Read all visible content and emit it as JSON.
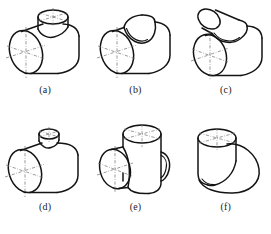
{
  "plate": {
    "title": "Intersections of cylinders with cylinders and a sphere",
    "background_color": "#ffffff",
    "line_color": "#141414",
    "centerline_color": "#6e6e6e",
    "rows": 2,
    "columns": 3
  },
  "figures": [
    {
      "label": "(a)",
      "name": "horizontal-cylinder-with-small-vertical-cylinder",
      "description": "Large horizontal cylinder with a small vertical cylinder rising from its top; shallow saddle intersection curve.",
      "base_solid": "horizontal cylinder",
      "added_solid": "vertical cylinder",
      "diameter_ratio": "small",
      "centerlines": "isometric three-axis cross on both end ellipse and top ellipse"
    },
    {
      "label": "(b)",
      "name": "horizontal-cylinder-with-large-vertical-cylinder",
      "description": "Horizontal cylinder pierced by a large vertical cylinder; deep curved saddle line of intersection cut into the top surface.",
      "base_solid": "horizontal cylinder",
      "added_solid": "vertical cylinder",
      "diameter_ratio": "large",
      "centerlines": "isometric three-axis cross on end ellipse"
    },
    {
      "label": "(c)",
      "name": "horizontal-cylinder-with-oblique-cylinder",
      "description": "Horizontal cylinder met by an inclined oblique cylinder at an angle; tangent intersection at the upper left.",
      "base_solid": "horizontal cylinder",
      "added_solid": "oblique inclined cylinder",
      "diameter_ratio": "equal",
      "centerlines": "isometric three-axis cross on end ellipse"
    },
    {
      "label": "(d)",
      "name": "horizontal-cylinder-with-tiny-boss",
      "description": "Horizontal cylinder with a very small vertical boss cylinder on top; nearly straight line of intersection.",
      "base_solid": "horizontal cylinder",
      "added_solid": "small vertical boss",
      "diameter_ratio": "very small",
      "centerlines": "isometric three-axis cross on end ellipse and boss top ellipse"
    },
    {
      "label": "(e)",
      "name": "vertical-cylinder-with-equal-horizontal-cylinder",
      "description": "Vertical cylinder joined by a horizontal cylinder of nearly equal diameter; intersection forms sharp elliptical crease.",
      "base_solid": "vertical cylinder",
      "added_solid": "horizontal cylinder",
      "diameter_ratio": "equal",
      "centerlines": "isometric three-axis cross on top ellipse and front ellipse"
    },
    {
      "label": "(f)",
      "name": "sphere-with-vertical-cylinder",
      "description": "Large sphere or dome penetrated by a vertical cylinder; circular curve of intersection on the spherical surface.",
      "base_solid": "sphere",
      "added_solid": "vertical cylinder",
      "diameter_ratio": "small relative to sphere",
      "centerlines": "isometric three-axis cross on top ellipse"
    }
  ]
}
